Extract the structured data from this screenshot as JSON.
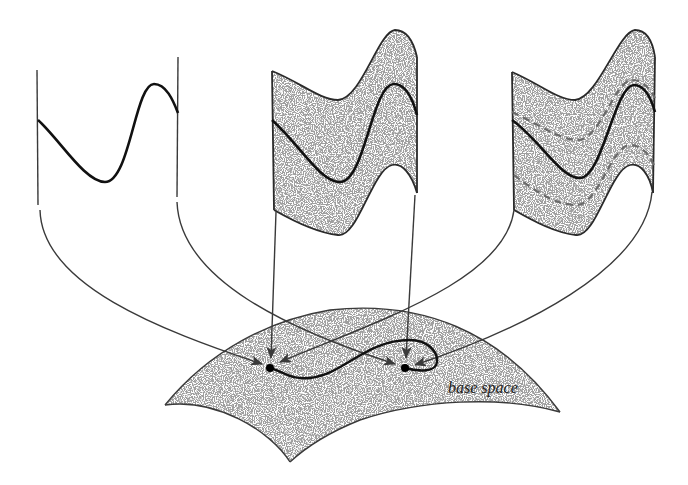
{
  "figure": {
    "base_space_label": "base space",
    "colors": {
      "line": "#3a3a3a",
      "section": "#111111",
      "stipple": "#9a9a9a",
      "background": "#ffffff"
    },
    "panels": [
      {
        "id": "fiber-single-section",
        "description": "single section curve between two fiber lines"
      },
      {
        "id": "fiber-shaded-band",
        "description": "shaded band of sections with one highlighted section"
      },
      {
        "id": "fiber-shaded-band-dashed",
        "description": "shaded band with highlighted section and dashed neighboring sections"
      }
    ],
    "base_points": [
      {
        "id": "point-a",
        "x": 270,
        "y": 368
      },
      {
        "id": "point-b",
        "x": 405,
        "y": 368
      }
    ]
  }
}
